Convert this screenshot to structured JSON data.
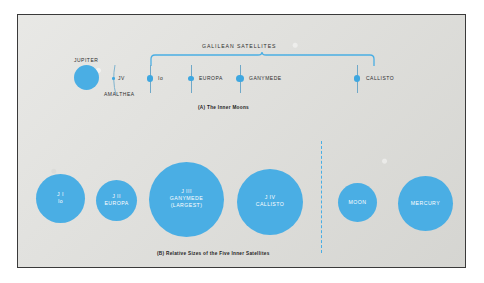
{
  "figure": {
    "background_color": "#dcdcd8",
    "accent_color": "#4aaee4",
    "border_color": "#3a3a3a"
  },
  "panel_a": {
    "caption": "(A)  The Inner Moons",
    "bracket_label": "GALILEAN SATELLITES",
    "jupiter_label": "JUPITER",
    "amalthea_label": "AMALTHEA",
    "bodies": [
      {
        "name": "jupiter",
        "label": "JUPITER",
        "cx": 84,
        "cy": 75,
        "r": 12.5
      },
      {
        "name": "amalthea",
        "label": "JV",
        "cx": 124,
        "cy": 75,
        "r": 1.4
      },
      {
        "name": "io",
        "label": "Io",
        "cx": 158,
        "cy": 75,
        "r": 3.2
      },
      {
        "name": "europa",
        "label": "EUROPA",
        "cx": 199,
        "cy": 75,
        "r": 2.9
      },
      {
        "name": "ganymede",
        "label": "GANYMEDE",
        "cx": 248,
        "cy": 75,
        "r": 3.6
      },
      {
        "name": "callisto",
        "label": "CALLISTO",
        "cx": 365,
        "cy": 75,
        "r": 3.4
      }
    ]
  },
  "panel_b": {
    "caption": "(B)  Relative Sizes of the Five Inner Satellites",
    "bodies": [
      {
        "name": "io",
        "lines": [
          "J I",
          "Io"
        ],
        "cx": 58,
        "cy": 189,
        "r": 24.5
      },
      {
        "name": "europa",
        "lines": [
          "J II",
          "EUROPA"
        ],
        "cx": 116,
        "cy": 191,
        "r": 20.5
      },
      {
        "name": "ganymede",
        "lines": [
          "J III",
          "GANYMEDE",
          "(LARGEST)"
        ],
        "cx": 185,
        "cy": 188,
        "r": 37.5
      },
      {
        "name": "callisto",
        "lines": [
          "J IV",
          "CALLISTO"
        ],
        "cx": 268,
        "cy": 190,
        "r": 33.0
      },
      {
        "name": "moon",
        "lines": [
          "MOON"
        ],
        "cx": 356,
        "cy": 193,
        "r": 19.5
      },
      {
        "name": "mercury",
        "lines": [
          "MERCURY"
        ],
        "cx": 424,
        "cy": 194,
        "r": 27.5
      }
    ]
  }
}
